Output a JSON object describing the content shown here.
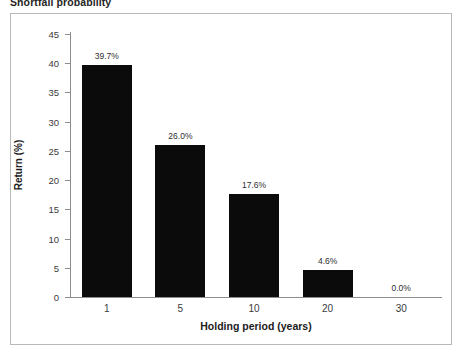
{
  "chart_data": {
    "type": "bar",
    "title": "Shortfall probability",
    "xlabel": "Holding period (years)",
    "ylabel": "Return (%)",
    "categories": [
      "1",
      "5",
      "10",
      "20",
      "30"
    ],
    "values": [
      39.7,
      26.0,
      17.6,
      4.6,
      0.0
    ],
    "data_labels": [
      "39.7%",
      "26.0%",
      "17.6%",
      "4.6%",
      "0.0%"
    ],
    "ylim": [
      0,
      45
    ],
    "ytick_labels": [
      "0",
      "5",
      "10",
      "15",
      "20",
      "25",
      "30",
      "35",
      "40",
      "45"
    ],
    "ytick_values": [
      0,
      5,
      10,
      15,
      20,
      25,
      30,
      35,
      40,
      45
    ],
    "grid": false,
    "legend": null,
    "bar_color": "#0b0b0b",
    "axis_color": "#8d8d8d",
    "frame_color": "#b9b9b9",
    "background": "#ffffff"
  }
}
